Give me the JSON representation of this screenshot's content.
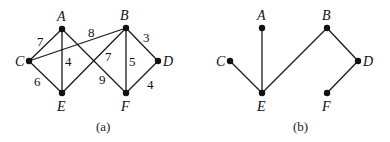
{
  "figure": {
    "colors": {
      "ink": "#111111",
      "background": "#ffffff"
    },
    "graph_a": {
      "caption": "(a)",
      "nodes": [
        {
          "id": "A",
          "label": "A",
          "x": 62,
          "y": 29,
          "lx": 57,
          "ly": 21
        },
        {
          "id": "B",
          "label": "B",
          "x": 126,
          "y": 28,
          "lx": 120,
          "ly": 20
        },
        {
          "id": "C",
          "label": "C",
          "x": 29,
          "y": 61,
          "lx": 15,
          "ly": 66
        },
        {
          "id": "D",
          "label": "D",
          "x": 158,
          "y": 61,
          "lx": 163,
          "ly": 66
        },
        {
          "id": "E",
          "label": "E",
          "x": 62,
          "y": 93,
          "lx": 57,
          "ly": 111
        },
        {
          "id": "F",
          "label": "F",
          "x": 126,
          "y": 93,
          "lx": 121,
          "ly": 111
        }
      ],
      "edges": [
        {
          "from": "C",
          "to": "A",
          "weight": "7",
          "wx": 37,
          "wy": 46
        },
        {
          "from": "C",
          "to": "B",
          "weight": "8",
          "wx": 88,
          "wy": 37
        },
        {
          "from": "C",
          "to": "E",
          "weight": "6",
          "wx": 34,
          "wy": 86
        },
        {
          "from": "A",
          "to": "E",
          "weight": "4",
          "wx": 65,
          "wy": 66
        },
        {
          "from": "A",
          "to": "F",
          "weight": "9",
          "wx": 99,
          "wy": 84
        },
        {
          "from": "E",
          "to": "B",
          "weight": "7",
          "wx": 105,
          "wy": 61
        },
        {
          "from": "B",
          "to": "F",
          "weight": "5",
          "wx": 129,
          "wy": 66
        },
        {
          "from": "B",
          "to": "D",
          "weight": "3",
          "wx": 143,
          "wy": 42
        },
        {
          "from": "F",
          "to": "D",
          "weight": "4",
          "wx": 147,
          "wy": 89
        }
      ]
    },
    "graph_b": {
      "caption": "(b)",
      "nodes": [
        {
          "id": "A",
          "label": "A",
          "x": 262,
          "y": 28,
          "lx": 257,
          "ly": 20
        },
        {
          "id": "B",
          "label": "B",
          "x": 327,
          "y": 28,
          "lx": 322,
          "ly": 20
        },
        {
          "id": "C",
          "label": "C",
          "x": 230,
          "y": 61,
          "lx": 216,
          "ly": 66
        },
        {
          "id": "D",
          "label": "D",
          "x": 358,
          "y": 61,
          "lx": 363,
          "ly": 66
        },
        {
          "id": "E",
          "label": "E",
          "x": 262,
          "y": 93,
          "lx": 257,
          "ly": 111
        },
        {
          "id": "F",
          "label": "F",
          "x": 327,
          "y": 93,
          "lx": 322,
          "ly": 111
        }
      ],
      "edges": [
        {
          "from": "C",
          "to": "E"
        },
        {
          "from": "A",
          "to": "E"
        },
        {
          "from": "E",
          "to": "B"
        },
        {
          "from": "B",
          "to": "D"
        },
        {
          "from": "D",
          "to": "F"
        }
      ]
    },
    "caption_positions": {
      "a": {
        "x": 96,
        "y": 131
      },
      "b": {
        "x": 293,
        "y": 131
      }
    }
  }
}
